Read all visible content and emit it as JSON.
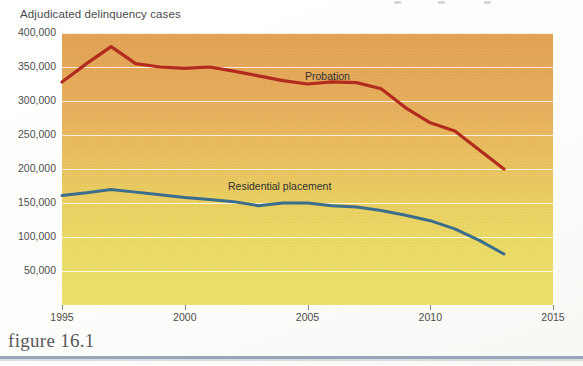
{
  "figure": {
    "caption": "figure 16.1"
  },
  "chart_data": {
    "type": "line",
    "title": "Adjudicated delinquency cases",
    "xlabel": "",
    "ylabel": "",
    "xlim": [
      1995,
      2015
    ],
    "ylim": [
      0,
      400000
    ],
    "grid": true,
    "legend_position": "inline-annotation",
    "x_ticks": [
      "1995",
      "2000",
      "2005",
      "2010",
      "2015"
    ],
    "x_tick_values": [
      1995,
      2000,
      2005,
      2010,
      2015
    ],
    "y_ticks": [
      "50,000",
      "100,000",
      "150,000",
      "200,000",
      "250,000",
      "300,000",
      "350,000",
      "400,000"
    ],
    "y_tick_values": [
      50000,
      100000,
      150000,
      200000,
      250000,
      300000,
      350000,
      400000
    ],
    "x": [
      1995,
      1996,
      1997,
      1998,
      1999,
      2000,
      2001,
      2002,
      2003,
      2004,
      2005,
      2006,
      2007,
      2008,
      2009,
      2010,
      2011,
      2012,
      2013
    ],
    "series": [
      {
        "name": "Probation",
        "color": "#b32b1e",
        "values": [
          328000,
          355000,
          380000,
          355000,
          350000,
          348000,
          350000,
          344000,
          337000,
          330000,
          325000,
          328000,
          327000,
          318000,
          290000,
          268000,
          256000,
          228000,
          200000
        ]
      },
      {
        "name": "Residential placement",
        "color": "#3b6d8c",
        "values": [
          161000,
          165000,
          170000,
          166000,
          162000,
          158000,
          155000,
          152000,
          146000,
          150000,
          150000,
          146000,
          144000,
          139000,
          132000,
          124000,
          112000,
          95000,
          75000
        ]
      }
    ],
    "annotations": [
      {
        "text": "Probation",
        "x": 2004,
        "y": 362000
      },
      {
        "text": "Residential placement",
        "x": 2001,
        "y": 192000
      }
    ],
    "colors": {
      "plot_top": "#e3a254",
      "plot_bottom": "#ece168",
      "gridline": "#ffffff",
      "caption_rule": "#97a5b8",
      "axis_text": "#4d4d4d"
    }
  }
}
